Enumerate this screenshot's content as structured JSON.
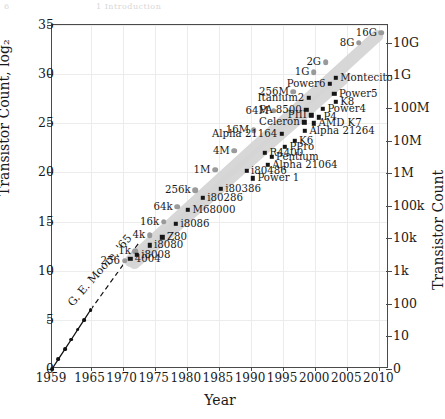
{
  "page_header_ghost": {
    "left": "6",
    "right": "1 Introduction"
  },
  "axes": {
    "xlabel": "Year",
    "ylabel": "Transistor Count, log₂",
    "y2label": "Transistor Count",
    "xticks": [
      "1959",
      "1965",
      "1970",
      "1975",
      "1980",
      "1985",
      "1990",
      "1995",
      "2000",
      "2005",
      "2010"
    ],
    "xtick_values": [
      1959,
      1965,
      1970,
      1975,
      1980,
      1985,
      1990,
      1995,
      2000,
      2005,
      2010
    ],
    "yticks": [
      "0",
      "5",
      "10",
      "15",
      "20",
      "25",
      "30",
      "35"
    ],
    "ytick_values": [
      0,
      5,
      10,
      15,
      20,
      25,
      30,
      35
    ],
    "y2ticks": [
      "0",
      "10",
      "100",
      "1k",
      "10k",
      "100k",
      "1M",
      "10M",
      "100M",
      "1G",
      "10G"
    ],
    "y2tick_values": [
      0,
      3.32,
      6.64,
      9.97,
      13.29,
      16.61,
      19.93,
      23.25,
      26.58,
      29.9,
      33.22
    ],
    "xlim": [
      1959,
      2011.5
    ],
    "ylim": [
      0,
      35
    ],
    "grid": true
  },
  "annotation": {
    "moore_label": "G. E. Moore, '65"
  },
  "colors": {
    "memory_marker": "#9a9a9a",
    "processor_marker": "#171717",
    "moore_marker": "#111111",
    "trend_band": "#d5d5d5",
    "grid": "#ececec",
    "frame": "#4a4a4a"
  },
  "chart_data": {
    "type": "scatter",
    "title": "",
    "xlabel": "Year",
    "ylabel": "Transistor Count, log₂",
    "y2label": "Transistor Count",
    "xlim": [
      1959,
      2011.5
    ],
    "ylim": [
      0,
      35
    ],
    "grid": true,
    "legend": "none",
    "series": [
      {
        "name": "Memory (DRAM)",
        "marker": "circle",
        "color": "#9a9a9a",
        "points": [
          {
            "label": "256",
            "x": 1970.3,
            "y": 11.0,
            "lpos": "r"
          },
          {
            "label": "1k",
            "x": 1972.0,
            "y": 12.0,
            "lpos": "r"
          },
          {
            "label": "4k",
            "x": 1974.2,
            "y": 13.6,
            "lpos": "r"
          },
          {
            "label": "16k",
            "x": 1976.4,
            "y": 15.0,
            "lpos": "r"
          },
          {
            "label": "64k",
            "x": 1978.5,
            "y": 16.5,
            "lpos": "r"
          },
          {
            "label": "256k",
            "x": 1981.3,
            "y": 18.2,
            "lpos": "r"
          },
          {
            "label": "1M",
            "x": 1984.4,
            "y": 20.3,
            "lpos": "r"
          },
          {
            "label": "4M",
            "x": 1987.4,
            "y": 22.2,
            "lpos": "r"
          },
          {
            "label": "16M",
            "x": 1990.4,
            "y": 24.3,
            "lpos": "r"
          },
          {
            "label": "64M",
            "x": 1993.5,
            "y": 26.3,
            "lpos": "r"
          },
          {
            "label": "256M",
            "x": 1996.6,
            "y": 28.2,
            "lpos": "r"
          },
          {
            "label": "1G",
            "x": 1999.8,
            "y": 30.2,
            "lpos": "r"
          },
          {
            "label": "2G",
            "x": 2001.6,
            "y": 31.2,
            "lpos": "r"
          },
          {
            "label": "8G",
            "x": 2006.8,
            "y": 33.2,
            "lpos": "r"
          },
          {
            "label": "16G",
            "x": 2010.3,
            "y": 34.2,
            "lpos": "r"
          }
        ]
      },
      {
        "name": "Processors",
        "marker": "square",
        "color": "#171717",
        "points": [
          {
            "label": "4004",
            "x": 1971.2,
            "y": 11.2,
            "lpos": "l"
          },
          {
            "label": "i8008",
            "x": 1972.2,
            "y": 11.6,
            "lpos": "l"
          },
          {
            "label": "i8080",
            "x": 1974.2,
            "y": 12.6,
            "lpos": "l"
          },
          {
            "label": "Z80",
            "x": 1976.2,
            "y": 13.4,
            "lpos": "l"
          },
          {
            "label": "i8086",
            "x": 1978.3,
            "y": 14.8,
            "lpos": "l"
          },
          {
            "label": "M68000",
            "x": 1980.2,
            "y": 16.2,
            "lpos": "l"
          },
          {
            "label": "i80286",
            "x": 1982.5,
            "y": 17.4,
            "lpos": "l"
          },
          {
            "label": "i80386",
            "x": 1985.3,
            "y": 18.3,
            "lpos": "l"
          },
          {
            "label": "i80486",
            "x": 1989.3,
            "y": 20.2,
            "lpos": "l"
          },
          {
            "label": "Power 1",
            "x": 1990.3,
            "y": 19.4,
            "lpos": "l"
          },
          {
            "label": "Pentium",
            "x": 1993.2,
            "y": 21.6,
            "lpos": "l"
          },
          {
            "label": "Alpha 21064",
            "x": 1992.6,
            "y": 20.8,
            "lpos": "l"
          },
          {
            "label": "R4400",
            "x": 1992.2,
            "y": 22.0,
            "lpos": "l"
          },
          {
            "label": "PPro",
            "x": 1995.3,
            "y": 22.6,
            "lpos": "l"
          },
          {
            "label": "K6",
            "x": 1996.8,
            "y": 23.2,
            "lpos": "l"
          },
          {
            "label": "Alpha 21164",
            "x": 1994.8,
            "y": 23.9,
            "lpos": "r"
          },
          {
            "label": "Alpha 21264",
            "x": 1998.4,
            "y": 24.2,
            "lpos": "l"
          },
          {
            "label": "Celeron",
            "x": 1998.3,
            "y": 25.1,
            "lpos": "r"
          },
          {
            "label": "AMD K7",
            "x": 1999.8,
            "y": 25.0,
            "lpos": "l"
          },
          {
            "label": "PIII",
            "x": 1999.4,
            "y": 25.8,
            "lpos": "r"
          },
          {
            "label": "PA 8500",
            "x": 1998.6,
            "y": 26.4,
            "lpos": "r"
          },
          {
            "label": "P4",
            "x": 2000.6,
            "y": 25.6,
            "lpos": "l"
          },
          {
            "label": "Power4",
            "x": 2001.2,
            "y": 26.5,
            "lpos": "l"
          },
          {
            "label": "K8",
            "x": 2003.2,
            "y": 27.2,
            "lpos": "l"
          },
          {
            "label": "Itanium2",
            "x": 1999.0,
            "y": 27.6,
            "lpos": "r"
          },
          {
            "label": "Power5",
            "x": 2003.0,
            "y": 28.0,
            "lpos": "l"
          },
          {
            "label": "Power6",
            "x": 2002.3,
            "y": 29.0,
            "lpos": "r"
          },
          {
            "label": "Montecito",
            "x": 2003.2,
            "y": 29.6,
            "lpos": "l"
          }
        ]
      },
      {
        "name": "Moore 1965 prediction",
        "marker": "dot-line",
        "color": "#111111",
        "points": [
          {
            "x": 1959,
            "y": 0
          },
          {
            "x": 1960,
            "y": 1
          },
          {
            "x": 1961,
            "y": 2
          },
          {
            "x": 1962,
            "y": 3
          },
          {
            "x": 1963,
            "y": 4
          },
          {
            "x": 1964,
            "y": 5
          },
          {
            "x": 1965,
            "y": 6
          }
        ],
        "extrapolation": {
          "x": [
            1965,
            1972.5
          ],
          "y": [
            6,
            12.8
          ]
        }
      }
    ],
    "trend_bands": [
      {
        "name": "memory-trend",
        "x0": 1970.5,
        "y0": 10.6,
        "x1": 2010.3,
        "y1": 34.3
      },
      {
        "name": "processor-trend",
        "x0": 1971.2,
        "y0": 10.4,
        "x1": 2005.0,
        "y1": 29.9
      }
    ]
  }
}
